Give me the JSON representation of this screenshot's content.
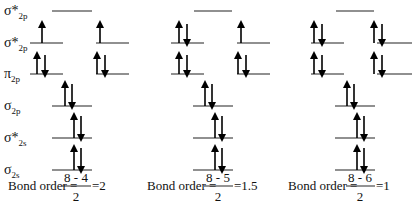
{
  "labels": [
    {
      "symbol": "σ*",
      "sub": "2p",
      "y": 15
    },
    {
      "symbol": "σ*",
      "sub": "2p",
      "y": 47
    },
    {
      "symbol": "π",
      "sub": "2p",
      "y": 78
    },
    {
      "symbol": "σ",
      "sub": "2p",
      "y": 110
    },
    {
      "symbol": "σ*",
      "sub": "2s",
      "y": 142
    },
    {
      "symbol": "σ",
      "sub": "2s",
      "y": 174
    }
  ],
  "diagrams": [
    {
      "bond_order": {
        "prefix": "Bond order =",
        "numerator": "8 - 4",
        "denominator": "2",
        "result": "=2"
      },
      "electrons": {
        "sigma_star_2p_top": 0,
        "pi_star_left": 1,
        "pi_star_right": 1,
        "pi_left": 2,
        "pi_right": 2,
        "sigma_2p": 2,
        "sigma_star_2s": 2,
        "sigma_2s": 2
      }
    },
    {
      "bond_order": {
        "prefix": "Bond order =",
        "numerator": "8 - 5",
        "denominator": "2",
        "result": "=1.5"
      },
      "electrons": {
        "sigma_star_2p_top": 0,
        "pi_star_left": 2,
        "pi_star_right": 1,
        "pi_left": 2,
        "pi_right": 2,
        "sigma_2p": 2,
        "sigma_star_2s": 2,
        "sigma_2s": 2
      }
    },
    {
      "bond_order": {
        "prefix": "Bond order =",
        "numerator": "8 - 6",
        "denominator": "2",
        "result": "=1"
      },
      "electrons": {
        "sigma_star_2p_top": 0,
        "pi_star_left": 2,
        "pi_star_right": 2,
        "pi_left": 2,
        "pi_right": 2,
        "sigma_2p": 2,
        "sigma_star_2s": 2,
        "sigma_2s": 2
      }
    }
  ],
  "colors": {
    "line": "#222222",
    "arrow": "#000000",
    "text": "#111111"
  }
}
